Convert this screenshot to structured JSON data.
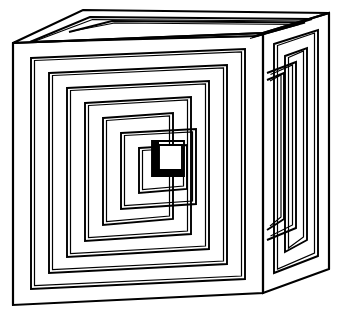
{
  "figure": {
    "title": "Nested cube optical illusion",
    "type": "line-art",
    "background_color": "#ffffff",
    "line_color": "#000000",
    "canvas": {
      "width": 342,
      "height": 318
    }
  },
  "geometry": {
    "front_face": {
      "name": "front-face",
      "corners": {
        "top_left": [
          13,
          43
        ],
        "top_right": [
          263,
          33
        ],
        "bottom_right": [
          263,
          293
        ],
        "bottom_left": [
          13,
          305
        ]
      },
      "ring_count": 8,
      "ring_inset_steps": [
        0,
        17,
        17,
        16,
        16,
        15,
        14,
        13
      ],
      "double_line_gap": 3
    },
    "right_face": {
      "name": "right-face",
      "corners": {
        "front_top": [
          263,
          33
        ],
        "back_top": [
          329,
          13
        ],
        "back_bottom": [
          329,
          269
        ],
        "front_bottom": [
          263,
          293
        ]
      },
      "ring_count": 4,
      "double_line_gap": 3
    },
    "top_face": {
      "name": "top-face",
      "corners": {
        "front_left": [
          13,
          43
        ],
        "back_left": [
          83,
          10
        ],
        "back_right": [
          329,
          13
        ],
        "front_right": [
          263,
          33
        ]
      },
      "ring_count": 2,
      "inner_rim_inset": 9
    },
    "center_detail": {
      "name": "innermost-square",
      "box": [
        153,
        142,
        30,
        30
      ],
      "has_thick_left_edge": true,
      "has_thick_bottom_edge": true
    }
  },
  "stroke_widths": {
    "outer_silhouette": 2.1,
    "frame_outer": 1.9,
    "frame_inner": 1.2,
    "top_face": 1.9
  }
}
